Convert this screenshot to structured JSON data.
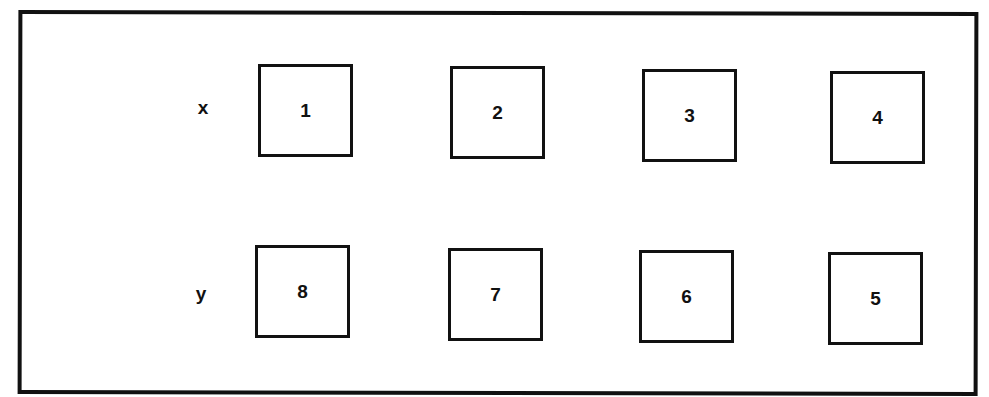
{
  "diagram": {
    "rows": [
      {
        "label": "x",
        "boxes": [
          "1",
          "2",
          "3",
          "4"
        ]
      },
      {
        "label": "y",
        "boxes": [
          "8",
          "7",
          "6",
          "5"
        ]
      }
    ]
  }
}
